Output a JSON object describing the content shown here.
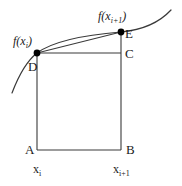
{
  "figure": {
    "type": "diagram",
    "background_color": "#ffffff",
    "stroke_color": "#3a3a3a",
    "point_fill_color": "#000000"
  },
  "labels": {
    "vertex_a": "A",
    "vertex_b": "B",
    "vertex_c": "C",
    "vertex_d": "D",
    "vertex_e": "E"
  },
  "functions": {
    "f_xi": "f(x",
    "f_xi_sub": "i",
    "f_xi_close": ")",
    "f_xi1": "f(x",
    "f_xi1_sub": "i+1",
    "f_xi1_close": ")"
  },
  "axis": {
    "x_i_base": "x",
    "x_i_sub": "i",
    "x_i1_base": "x",
    "x_i1_sub": "i+1"
  },
  "geometry": {
    "point_a": [
      37,
      150
    ],
    "point_b": [
      121,
      150
    ],
    "point_c": [
      121,
      53
    ],
    "point_d": [
      37,
      53
    ],
    "point_e": [
      121,
      32
    ],
    "curve_start": [
      12,
      93
    ],
    "curve_end": [
      171,
      10
    ],
    "marker_radius": 3.4
  }
}
